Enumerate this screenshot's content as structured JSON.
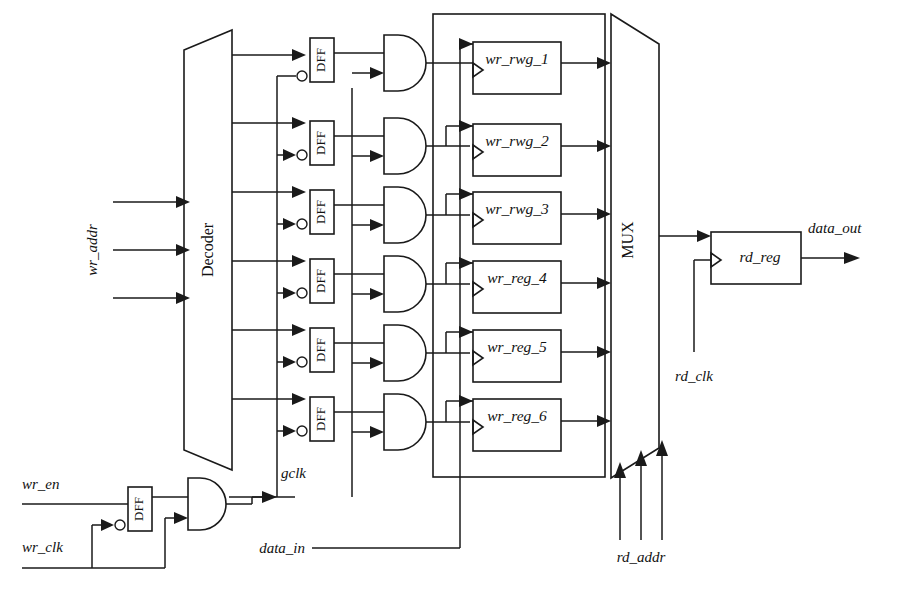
{
  "diagram": {
    "type": "digital-logic-schematic"
  },
  "blocks": {
    "decoder": {
      "label": "Decoder",
      "shape": "trapezoid"
    },
    "mux": {
      "label": "MUX",
      "shape": "trapezoid"
    },
    "rd_reg": {
      "label": "rd_reg",
      "shape": "rectangle"
    },
    "dff": {
      "label": "DFF"
    }
  },
  "registers": [
    {
      "label": "wr_rwg_1"
    },
    {
      "label": "wr_rwg_2"
    },
    {
      "label": "wr_rwg_3"
    },
    {
      "label": "wr_reg_4"
    },
    {
      "label": "wr_reg_5"
    },
    {
      "label": "wr_reg_6"
    }
  ],
  "signals": {
    "wr_addr": "wr_addr",
    "wr_en": "wr_en",
    "wr_clk": "wr_clk",
    "gclk": "gclk",
    "data_in": "data_in",
    "rd_addr": "rd_addr",
    "rd_clk": "rd_clk",
    "data_out": "data_out"
  },
  "counts": {
    "wr_addr_lines": 3,
    "rd_addr_lines": 3,
    "register_rows": 6,
    "dff_gate_rows": 6
  },
  "colors": {
    "line": "#1a1a1a",
    "background": "#ffffff"
  }
}
